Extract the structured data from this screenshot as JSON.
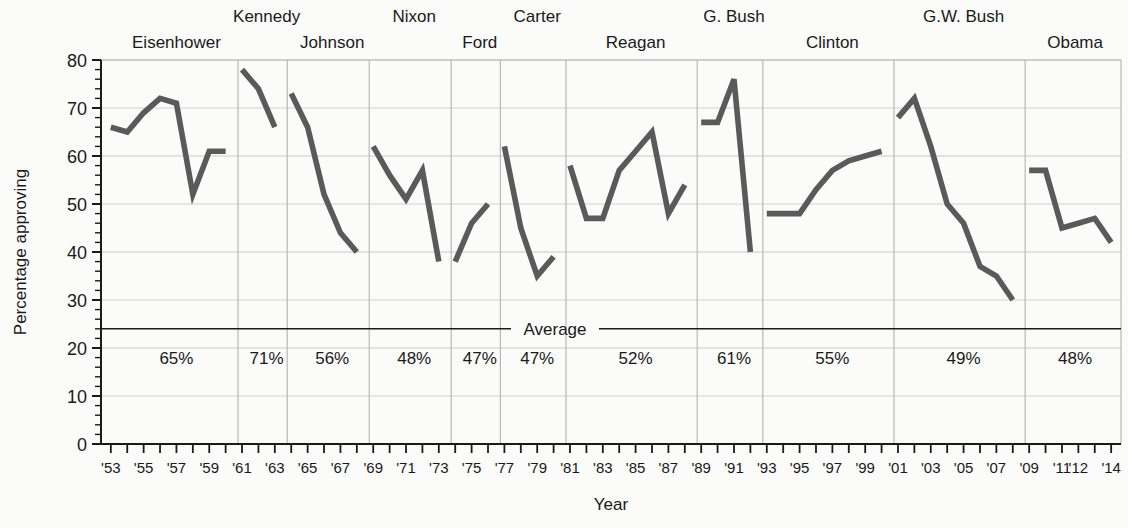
{
  "chart_data": {
    "type": "line",
    "title": "",
    "xlabel": "Year",
    "ylabel": "Percentage approving",
    "ylim": [
      0,
      80
    ],
    "ytick_step": 10,
    "grid": true,
    "legend_position": "none",
    "average_line": {
      "label": "Average",
      "value": 24
    },
    "ytick_labels": [
      "0",
      "10",
      "20",
      "30",
      "40",
      "50",
      "60",
      "70",
      "80"
    ],
    "xtick_labels": [
      "'53",
      "'55",
      "'57",
      "'59",
      "'61",
      "'63",
      "'65",
      "'67",
      "'69",
      "'71",
      "'73",
      "'75",
      "'77",
      "'79",
      "'81",
      "'83",
      "'85",
      "'87",
      "'89",
      "'91",
      "'93",
      "'95",
      "'97",
      "'99",
      "'01",
      "'03",
      "'05",
      "'07",
      "'09",
      "'11",
      "'12",
      "'14"
    ],
    "xtick_years": [
      1953,
      1955,
      1957,
      1959,
      1961,
      1963,
      1965,
      1967,
      1969,
      1971,
      1973,
      1975,
      1977,
      1979,
      1981,
      1983,
      1985,
      1987,
      1989,
      1991,
      1993,
      1995,
      1997,
      1999,
      2001,
      2003,
      2005,
      2007,
      2009,
      2011,
      2012,
      2014
    ],
    "x_range": [
      1952.4,
      2014.6
    ],
    "presidents": [
      {
        "name": "Eisenhower",
        "label_row": 1,
        "average_label": "65%",
        "average": 65,
        "term_start": 1953,
        "term_end": 1961,
        "x": [
          1953,
          1954,
          1955,
          1956,
          1957,
          1958,
          1959,
          1960
        ],
        "y": [
          66,
          65,
          69,
          72,
          71,
          52,
          61,
          61
        ]
      },
      {
        "name": "Kennedy",
        "label_row": 0,
        "average_label": "71%",
        "average": 71,
        "term_start": 1961,
        "term_end": 1964,
        "x": [
          1961,
          1962,
          1963
        ],
        "y": [
          78,
          74,
          66
        ]
      },
      {
        "name": "Johnson",
        "label_row": 1,
        "average_label": "56%",
        "average": 56,
        "term_start": 1964,
        "term_end": 1969,
        "x": [
          1964,
          1965,
          1966,
          1967,
          1968
        ],
        "y": [
          73,
          66,
          52,
          44,
          40
        ]
      },
      {
        "name": "Nixon",
        "label_row": 0,
        "average_label": "48%",
        "average": 48,
        "term_start": 1969,
        "term_end": 1974,
        "x": [
          1969,
          1970,
          1971,
          1972,
          1973
        ],
        "y": [
          62,
          56,
          51,
          57,
          38
        ]
      },
      {
        "name": "Ford",
        "label_row": 1,
        "average_label": "47%",
        "average": 47,
        "term_start": 1974,
        "term_end": 1977,
        "x": [
          1974,
          1975,
          1976
        ],
        "y": [
          38,
          46,
          50
        ]
      },
      {
        "name": "Carter",
        "label_row": 0,
        "average_label": "47%",
        "average": 47,
        "term_start": 1977,
        "term_end": 1981,
        "x": [
          1977,
          1978,
          1979,
          1980
        ],
        "y": [
          62,
          45,
          35,
          39
        ]
      },
      {
        "name": "Reagan",
        "label_row": 1,
        "average_label": "52%",
        "average": 52,
        "term_start": 1981,
        "term_end": 1989,
        "x": [
          1981,
          1982,
          1983,
          1984,
          1985,
          1986,
          1987,
          1988
        ],
        "y": [
          58,
          47,
          47,
          57,
          61,
          65,
          48,
          54
        ]
      },
      {
        "name": "G. Bush",
        "label_row": 0,
        "average_label": "61%",
        "average": 61,
        "term_start": 1989,
        "term_end": 1993,
        "x": [
          1989,
          1990,
          1991,
          1992
        ],
        "y": [
          67,
          67,
          76,
          40
        ]
      },
      {
        "name": "Clinton",
        "label_row": 1,
        "average_label": "55%",
        "average": 55,
        "term_start": 1993,
        "term_end": 2001,
        "x": [
          1993,
          1994,
          1995,
          1996,
          1997,
          1998,
          1999,
          2000
        ],
        "y": [
          48,
          48,
          48,
          53,
          57,
          59,
          60,
          61
        ]
      },
      {
        "name": "G.W. Bush",
        "label_row": 0,
        "average_label": "49%",
        "average": 49,
        "term_start": 2001,
        "term_end": 2009,
        "x": [
          2001,
          2002,
          2003,
          2004,
          2005,
          2006,
          2007,
          2008
        ],
        "y": [
          68,
          72,
          62,
          50,
          46,
          37,
          35,
          30
        ]
      },
      {
        "name": "Obama",
        "label_row": 1,
        "average_label": "48%",
        "average": 48,
        "term_start": 2009,
        "term_end": 2014.6,
        "x": [
          2009,
          2010,
          2011,
          2012,
          2013,
          2014
        ],
        "y": [
          57,
          57,
          45,
          46,
          47,
          42
        ]
      }
    ],
    "colors": {
      "line": "#5a5a5a",
      "grid": "#c9c9c9",
      "divider": "#b8b8b8",
      "axis": "#1a1a1a",
      "average_line": "#1a1a1a",
      "background": "#fbfbfa"
    }
  }
}
